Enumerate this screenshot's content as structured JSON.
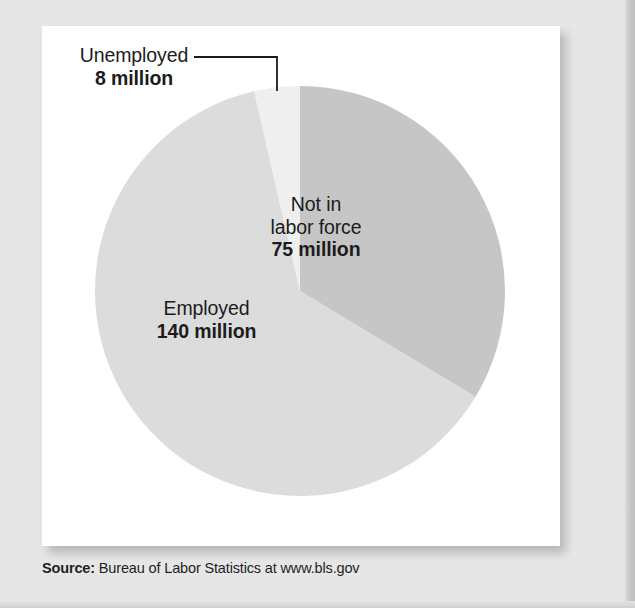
{
  "chart_data": {
    "type": "pie",
    "title": "",
    "subtitle": "",
    "unit": "million",
    "total": 223,
    "categories": [
      "Not in labor force",
      "Employed",
      "Unemployed"
    ],
    "values": [
      75,
      140,
      8
    ],
    "slices": [
      {
        "name": "Not in labor force",
        "label_line1": "Not in",
        "label_line2": "labor force",
        "value_label": "75 million",
        "value": 75,
        "color": "#c6c6c6",
        "start_angle_deg": 0,
        "end_angle_deg": 121.1,
        "label_placement": "inside-right"
      },
      {
        "name": "Employed",
        "label_line1": "Employed",
        "label_line2": "",
        "value_label": "140 million",
        "value": 140,
        "color": "#dcdcdc",
        "start_angle_deg": 121.1,
        "end_angle_deg": 347.1,
        "label_placement": "inside-left"
      },
      {
        "name": "Unemployed",
        "label_line1": "Unemployed",
        "label_line2": "",
        "value_label": "8 million",
        "value": 8,
        "color": "#efefef",
        "start_angle_deg": 347.1,
        "end_angle_deg": 360,
        "label_placement": "outside-top-left-with-leader"
      }
    ],
    "legend": "none",
    "grid": false,
    "background_color": "#ffffff"
  },
  "card": {
    "background_color": "#ffffff"
  },
  "source": {
    "label": "Source:",
    "text": " Bureau of Labor Statistics at www.bls.gov"
  }
}
